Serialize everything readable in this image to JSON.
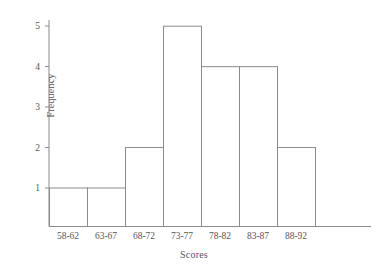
{
  "chart_data": {
    "type": "bar",
    "title": "",
    "subtitle": "",
    "xlabel": "Scores",
    "ylabel": "Frequency",
    "categories": [
      "58-62",
      "63-67",
      "68-72",
      "73-77",
      "78-82",
      "83-87",
      "88-92"
    ],
    "values": [
      1,
      1,
      2,
      5,
      4,
      4,
      2
    ],
    "ytick_labels": [
      "1",
      "2",
      "3",
      "4",
      "5"
    ],
    "ytick_values": [
      1,
      2,
      3,
      4,
      5
    ],
    "ylim": [
      0,
      5.4
    ],
    "grid": false,
    "legend": null,
    "legend_position": "none",
    "bar_style": "histogram-outline-adjacent",
    "colors": {
      "bar_fill": "#ffffff",
      "bar_stroke": "#8a8a8a",
      "axis": "#8a8a8a",
      "text": "#55565a",
      "background": "#ffffff"
    }
  },
  "axes": {
    "y_title": "Frequency",
    "x_title": "Scores"
  }
}
